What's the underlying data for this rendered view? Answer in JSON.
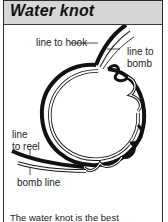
{
  "panel": {
    "title": "Water knot"
  },
  "diagram": {
    "labels": {
      "line_to_hook": "line to hook",
      "line_to_bomb_1": "line to",
      "line_to_bomb_2": "bomb",
      "line_to_reel_1": "line",
      "line_to_reel_2": "to reel",
      "bomb_line": "bomb line"
    }
  },
  "caption": {
    "text": "The water knot is the best"
  },
  "colors": {
    "header_bg": "#d6d6d6",
    "line_dark": "#111111",
    "border": "#2a2a2a"
  }
}
